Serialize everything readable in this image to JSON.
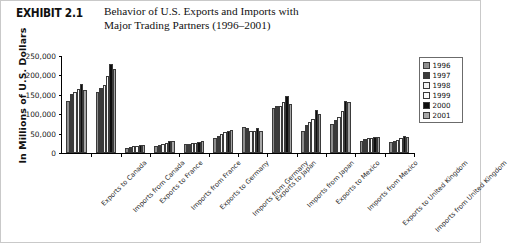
{
  "header": {
    "exhibit_number": "EXHIBIT 2.1",
    "caption_line1": "Behavior of U.S. Exports and Imports with",
    "caption_line2": "Major Trading Partners (1996–2001)"
  },
  "legend": {
    "position": "right",
    "items": [
      {
        "label": "1996",
        "color": "#8f8f8f"
      },
      {
        "label": "1997",
        "color": "#3b3b3b"
      },
      {
        "label": "1998",
        "color": "#f3f3f3"
      },
      {
        "label": "1999",
        "color": "#fbfbfb"
      },
      {
        "label": "2000",
        "color": "#0d0d0d"
      },
      {
        "label": "2001",
        "color": "#a8a8a8"
      }
    ]
  },
  "axes": {
    "y_title": "In Millions of U.S. Dollars",
    "y_ticks": [
      "250,000",
      "200,000",
      "150,000",
      "100,000",
      "50,000",
      "0"
    ],
    "y_min": 0,
    "y_max": 250000,
    "y_step": 50000
  },
  "chart_data": {
    "type": "bar",
    "title": "Behavior of U.S. Exports and Imports with Major Trading Partners (1996–2001)",
    "xlabel": "",
    "ylabel": "In Millions of U.S. Dollars",
    "ylim": [
      0,
      250000
    ],
    "ytick_values": [
      0,
      50000,
      100000,
      150000,
      200000,
      250000
    ],
    "grid": false,
    "legend_position": "right",
    "categories": [
      "Exports to Canada",
      "Imports from Canada",
      "Exports to France",
      "Imports from France",
      "Exports to Germany",
      "Imports from Germany",
      "Exports to Japan",
      "Imports from Japan",
      "Exports to Mexico",
      "Imports from Mexico",
      "Exports to United Kingdom",
      "Imports from United Kingdom"
    ],
    "series": [
      {
        "name": "1996",
        "values": [
          134000,
          156000,
          14000,
          18000,
          23000,
          38000,
          67000,
          115000,
          57000,
          74000,
          31000,
          29000
        ]
      },
      {
        "name": "1997",
        "values": [
          151000,
          168000,
          16000,
          20000,
          24000,
          43000,
          65000,
          121000,
          71000,
          85000,
          36000,
          32000
        ]
      },
      {
        "name": "1998",
        "values": [
          156000,
          175000,
          17000,
          24000,
          26000,
          49000,
          57000,
          122000,
          79000,
          94000,
          39000,
          34000
        ]
      },
      {
        "name": "1999",
        "values": [
          166000,
          199000,
          19000,
          25000,
          26000,
          55000,
          57000,
          131000,
          87000,
          109000,
          38000,
          39000
        ]
      },
      {
        "name": "2000",
        "values": [
          178000,
          230000,
          20000,
          30000,
          29000,
          58000,
          65000,
          146000,
          111000,
          135000,
          41000,
          43000
        ]
      },
      {
        "name": "2001",
        "values": [
          163000,
          217000,
          20000,
          30000,
          30000,
          60000,
          57000,
          126000,
          101000,
          131000,
          40000,
          41000
        ]
      }
    ]
  }
}
